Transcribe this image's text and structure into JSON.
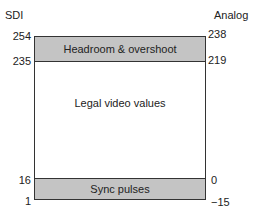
{
  "headers": {
    "left": "SDI",
    "right": "Analog"
  },
  "regions": {
    "headroom": "Headroom & overshoot",
    "legal": "Legal video values",
    "sync": "Sync pulses"
  },
  "sdi_ticks": [
    "254",
    "235",
    "16",
    "1"
  ],
  "analog_ticks": [
    "238",
    "219",
    "0",
    "−15"
  ],
  "colors": {
    "band": "#c4c4c4",
    "border": "#333333"
  }
}
